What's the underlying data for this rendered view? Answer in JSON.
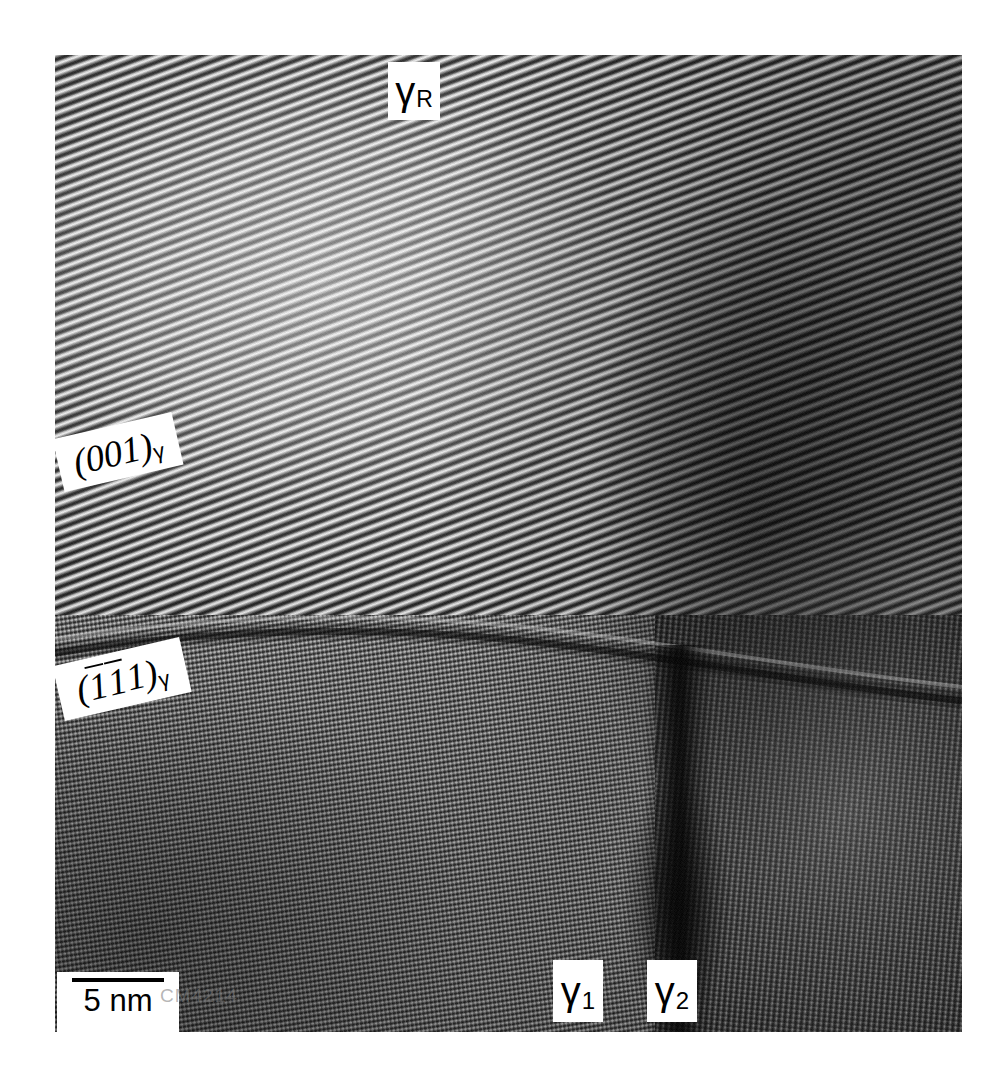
{
  "figure": {
    "kind": "hrtem-micrograph",
    "frame": {
      "page_width": 1007,
      "page_height": 1087,
      "image_left": 55,
      "image_top": 55,
      "image_width": 907,
      "image_height": 977,
      "background_color": "#ffffff"
    }
  },
  "labels": {
    "gamma_r": {
      "symbol": "γ",
      "subscript": "R"
    },
    "gamma_1": {
      "symbol": "γ",
      "subscript": "1"
    },
    "gamma_2": {
      "symbol": "γ",
      "subscript": "2"
    },
    "plane_001": {
      "open": "(",
      "indices": "001",
      "close": ")",
      "subscript": "γ",
      "text": "(001)γ"
    },
    "plane_111": {
      "open": "(",
      "index_1": "1",
      "index_1_bar": true,
      "index_2": "1",
      "index_2_bar": true,
      "index_3": "1",
      "index_3_bar": false,
      "close": ")",
      "subscript": "γ",
      "text": "(̑1̑1 1)γ"
    }
  },
  "scalebar": {
    "label": "5 nm",
    "value": 5,
    "unit": "nm",
    "bar_length_px": 92
  },
  "watermark": {
    "text": "CM4214"
  },
  "grains": [
    {
      "id": "gamma-R",
      "label": "γR",
      "position": "upper",
      "fringe_angle_deg": -20,
      "fringe_spacing_px": 9,
      "brightness": "bright upper-left fading to dark upper-right"
    },
    {
      "id": "gamma-1",
      "label": "γ1",
      "position": "lower-left",
      "fringe_angle_deg": -9,
      "fringe_spacing_px": 5,
      "brightness": "medium grey, fine dense fringes"
    },
    {
      "id": "gamma-2",
      "label": "γ2",
      "position": "lower-right",
      "fringe_angle_deg": 95,
      "fringe_spacing_px": 6,
      "brightness": "darkest, near-vertical fringes"
    }
  ],
  "boundaries": [
    {
      "id": "gammaR-gamma1",
      "type": "curved-interface",
      "orientation": "horizontal",
      "approx_y": 580
    },
    {
      "id": "gamma1-gamma2",
      "type": "grain-boundary",
      "orientation": "vertical",
      "approx_x": 620
    }
  ],
  "colors": {
    "page_background": "#ffffff",
    "label_background": "#ffffff",
    "label_text": "#000000",
    "scalebar": "#000000",
    "grain_dark": "#1b1b1b",
    "grain_light": "#f2f2f2"
  }
}
